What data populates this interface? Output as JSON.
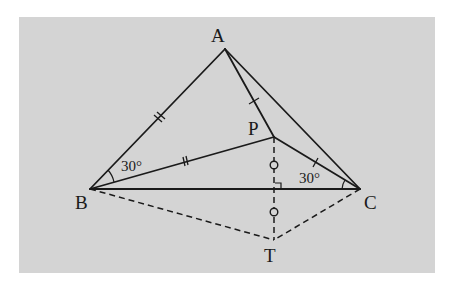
{
  "diagram": {
    "type": "geometry",
    "background_color": "#d4d4d4",
    "line_color": "#1a1a1a",
    "points": {
      "A": {
        "label": "A",
        "x": 225,
        "y": 49
      },
      "B": {
        "label": "B",
        "x": 90,
        "y": 189
      },
      "C": {
        "label": "C",
        "x": 360,
        "y": 189
      },
      "P": {
        "label": "P",
        "x": 274,
        "y": 137
      },
      "T": {
        "label": "T",
        "x": 274,
        "y": 240
      }
    },
    "segments": [
      {
        "from": "A",
        "to": "B",
        "style": "solid",
        "ticks": 2
      },
      {
        "from": "A",
        "to": "C",
        "style": "solid",
        "ticks": 0
      },
      {
        "from": "B",
        "to": "C",
        "style": "solid",
        "ticks": 0
      },
      {
        "from": "A",
        "to": "P",
        "style": "solid",
        "ticks": 1
      },
      {
        "from": "B",
        "to": "P",
        "style": "solid",
        "ticks": 2
      },
      {
        "from": "P",
        "to": "C",
        "style": "solid",
        "ticks": 1
      },
      {
        "from": "B",
        "to": "T",
        "style": "dashed",
        "ticks": 0
      },
      {
        "from": "C",
        "to": "T",
        "style": "dashed",
        "ticks": 0
      },
      {
        "from": "P",
        "to": "T",
        "style": "dashed",
        "marks": "circle"
      }
    ],
    "angles": [
      {
        "vertex": "B",
        "label": "30°"
      },
      {
        "vertex": "C",
        "label": "30°"
      }
    ],
    "right_angle": {
      "at": "intersection of PT and BC"
    }
  },
  "labels": {
    "A": "A",
    "B": "B",
    "C": "C",
    "P": "P",
    "T": "T",
    "angle_B": "30°",
    "angle_C": "30°"
  }
}
